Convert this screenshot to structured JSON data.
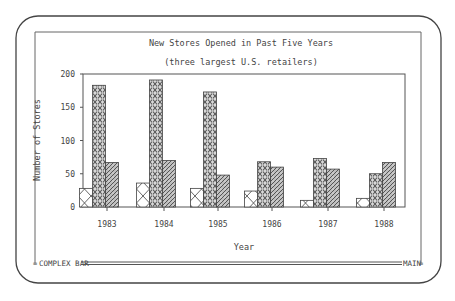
{
  "screen": {
    "status_left": "COMPLEX BAR",
    "status_right": "MAIN"
  },
  "chart_data": {
    "type": "bar",
    "title": "New Stores Opened in Past Five Years",
    "subtitle": "(three largest U.S. retailers)",
    "xlabel": "Year",
    "ylabel": "Number of Stores",
    "categories": [
      "1983",
      "1984",
      "1985",
      "1986",
      "1987",
      "1988"
    ],
    "series": [
      {
        "name": "Retailer 1",
        "pattern": "cross-hatch",
        "values": [
          28,
          36,
          28,
          24,
          10,
          13
        ]
      },
      {
        "name": "Retailer 2",
        "pattern": "diamond-lattice",
        "values": [
          183,
          191,
          173,
          68,
          73,
          50
        ]
      },
      {
        "name": "Retailer 3",
        "pattern": "diagonal-hatch",
        "values": [
          67,
          70,
          48,
          60,
          57,
          67
        ]
      }
    ],
    "yticks": [
      0,
      50,
      100,
      150,
      200
    ],
    "ylim": [
      0,
      200
    ],
    "grid": false,
    "legend": "none"
  }
}
